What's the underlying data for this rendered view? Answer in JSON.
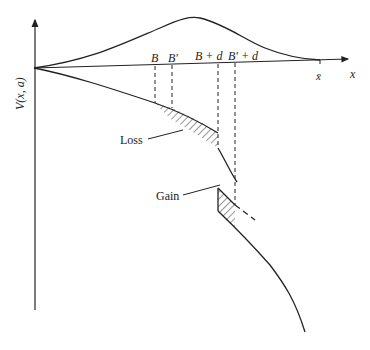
{
  "diagram": {
    "type": "economic value function diagram",
    "y_axis_label": "V(x, a)",
    "x_axis_label": "x",
    "x_max_label": "x̄",
    "tick_labels": [
      "B",
      "B'",
      "B + d",
      "B' + d"
    ],
    "region_labels": {
      "loss": "Loss",
      "gain": "Gain"
    },
    "curves": [
      {
        "name": "density-curve",
        "description": "bell-shaped curve above x-axis peaking between B and B'"
      },
      {
        "name": "value-curve",
        "description": "decreasing concave curve below x-axis with a discontinuous drop at B + d"
      }
    ],
    "colors": {
      "line": "#222222",
      "background": "#ffffff"
    }
  }
}
